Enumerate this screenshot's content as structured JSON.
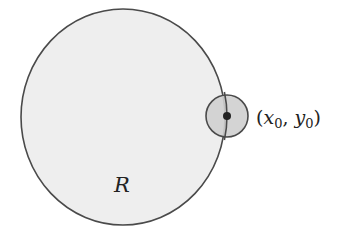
{
  "diagram": {
    "region": {
      "label": "R",
      "fill": "#eeeeee",
      "stroke": "#4a4a4a",
      "cx": 123,
      "cy": 117,
      "rx": 102,
      "ry": 108
    },
    "neighborhood": {
      "fill": "#cfcfcf",
      "stroke": "#4a4a4a",
      "cx": 227,
      "cy": 116,
      "r": 21
    },
    "point": {
      "fill": "#222222",
      "cx": 227,
      "cy": 116,
      "r": 4,
      "label": {
        "open": "(",
        "x": "x",
        "x_sub": "0",
        "sep": ", ",
        "y": "y",
        "y_sub": "0",
        "close": ")"
      }
    }
  }
}
